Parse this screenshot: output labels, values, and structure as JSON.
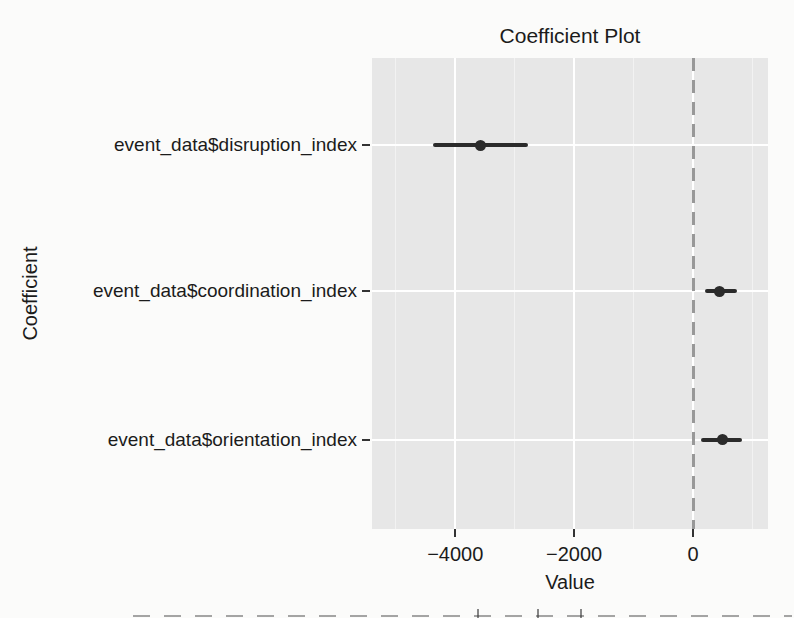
{
  "chart_data": {
    "type": "pointrange",
    "orientation": "horizontal",
    "title": "Coefficient Plot",
    "xlabel": "Value",
    "ylabel": "Coefficient",
    "categories": [
      "event_data$disruption_index",
      "event_data$coordination_index",
      "event_data$orientation_index"
    ],
    "series": [
      {
        "name": "event_data$disruption_index",
        "estimate": -3580,
        "ci_low": -4370,
        "ci_high": -2780
      },
      {
        "name": "event_data$coordination_index",
        "estimate": 450,
        "ci_low": 200,
        "ci_high": 740
      },
      {
        "name": "event_data$orientation_index",
        "estimate": 490,
        "ci_low": 140,
        "ci_high": 820
      }
    ],
    "x_major_ticks": [
      -4000,
      -2000,
      0
    ],
    "x_tick_labels": [
      "−4000",
      "−2000",
      "0"
    ],
    "x_minor_ticks": [
      -5000,
      -3000,
      -1000,
      1000
    ],
    "xlim": [
      -5400,
      1260
    ],
    "zero_reference_line": {
      "x": 0,
      "style": "dashed"
    },
    "grid": true,
    "legend": "none",
    "panel_bg": "#e7e7e7",
    "grid_major_color": "#ffffff",
    "grid_minor_color": "#f2f2f2",
    "point_color": "#2b2b2b",
    "zero_line_color": "#989898",
    "text_color": "#1b1b1b"
  }
}
